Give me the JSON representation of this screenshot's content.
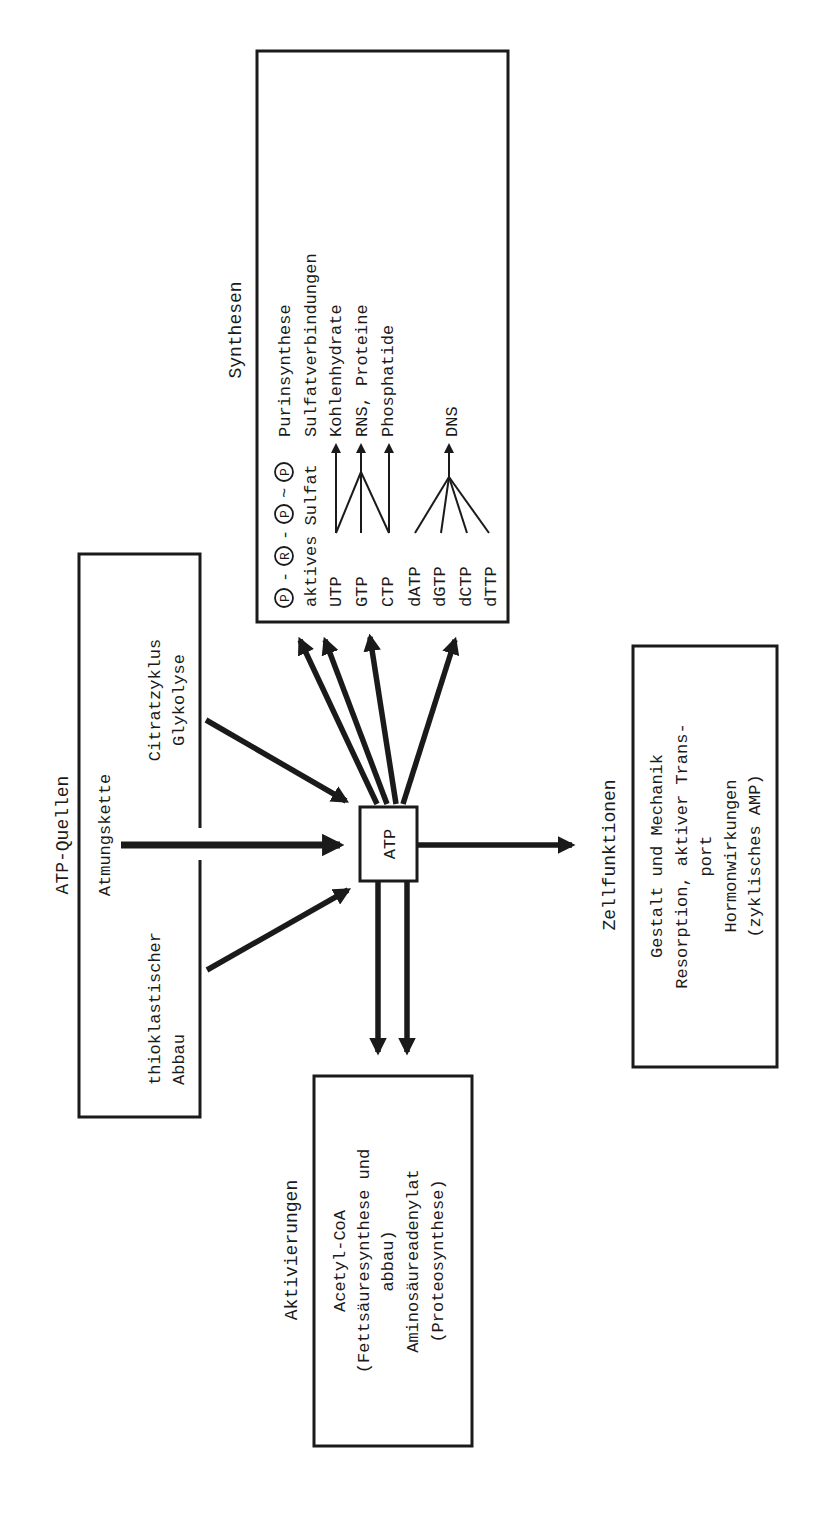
{
  "diagram": {
    "orientation": "rotated 90° counter-clockwise (text reads bottom-to-top)",
    "center": {
      "label": "ATP"
    },
    "sources": {
      "title": "ATP-Quellen",
      "items": [
        "Atmungskette",
        "Citratzyklus",
        "Glykolyse",
        "thioklastischer",
        "Abbau"
      ]
    },
    "synthesen": {
      "title": "Synthesen",
      "header_row": {
        "symbols": [
          "P",
          "R",
          "P",
          "P"
        ],
        "separators": [
          "-",
          "-",
          "~"
        ],
        "target": "Purinsynthese"
      },
      "rows": [
        {
          "source": "aktives Sulfat",
          "target": "Sulfatverbindungen"
        },
        {
          "source": "UTP",
          "target": "Kohlenhydrate"
        },
        {
          "source": "GTP",
          "target": "RNS, Proteine"
        },
        {
          "source": "CTP",
          "target": "Phosphatide"
        },
        {
          "source": "dATP",
          "target": ""
        },
        {
          "source": "dGTP",
          "target": "DNS"
        },
        {
          "source": "dCTP",
          "target": ""
        },
        {
          "source": "dTTP",
          "target": ""
        }
      ],
      "dns_label": "DNS"
    },
    "aktivierungen": {
      "title": "Aktivierungen",
      "lines": [
        "Acetyl-CoA",
        "(Fettsäuresynthese und",
        "abbau)",
        "Aminosäureadenylat",
        "(Proteosynthese)"
      ]
    },
    "zellfunktionen": {
      "title": "Zellfunktionen",
      "lines": [
        "Gestalt und Mechanik",
        "Resorption, aktiver Trans-",
        "port",
        "Hormonwirkungen",
        "(zyklisches AMP)"
      ]
    },
    "colors": {
      "ink": "#1a1a1a",
      "background": "#ffffff"
    }
  }
}
